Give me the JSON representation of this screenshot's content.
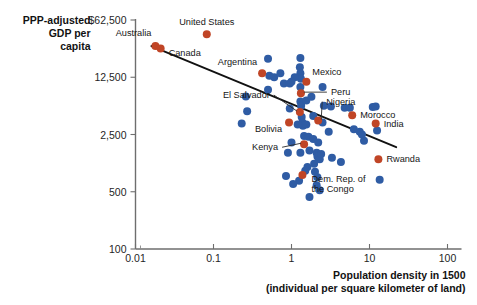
{
  "chart_data": {
    "type": "scatter",
    "title": "",
    "xlabel": "Population density in 1500",
    "xlabel_sub": "(individual per square kilometer of land)",
    "ylabel_lines": [
      "PPP-adjusted",
      "GDP per",
      "capita"
    ],
    "xscale": "log",
    "yscale": "log",
    "xlim": [
      0.01,
      100
    ],
    "ylim": [
      100,
      62500
    ],
    "grid": false,
    "legend": "none",
    "xticks": [
      "0.01",
      "0.1",
      "1",
      "10",
      "100"
    ],
    "xtick_values": [
      0.01,
      0.1,
      1,
      10,
      100
    ],
    "yticks": [
      "$62,500",
      "12,500",
      "2,500",
      "500",
      "100"
    ],
    "ytick_values": [
      62500,
      12500,
      2500,
      500,
      100
    ],
    "colors": {
      "highlight": "#c04526",
      "regular": "#2f5ca4",
      "trendline": "#111111",
      "axis": "#6e6e6e",
      "text": "#1b1b1b"
    },
    "trendline": {
      "x0": 0.016,
      "y0": 30000,
      "x1": 22,
      "y1": 1750,
      "note": "downward sloping fit line"
    },
    "labeled_points": [
      {
        "name": "Australia",
        "x": 0.018,
        "y": 30000,
        "color": "highlight",
        "label_dx": -4,
        "label_dy": -10,
        "anchor": "end"
      },
      {
        "name": "Canada",
        "x": 0.021,
        "y": 28000,
        "color": "highlight",
        "label_dx": 8,
        "label_dy": 7,
        "anchor": "start"
      },
      {
        "name": "United States",
        "x": 0.082,
        "y": 42000,
        "color": "highlight",
        "label_dx": 0,
        "label_dy": -9,
        "anchor": "middle"
      },
      {
        "name": "Argentina",
        "x": 0.42,
        "y": 14000,
        "color": "highlight",
        "label_dx": -5,
        "label_dy": -8,
        "anchor": "end"
      },
      {
        "name": "Mexico",
        "x": 1.55,
        "y": 11000,
        "color": "highlight",
        "label_dx": 6,
        "label_dy": -7,
        "anchor": "start"
      },
      {
        "name": "Peru",
        "x": 1.32,
        "y": 8000,
        "color": "highlight",
        "label_dx": 30,
        "label_dy": 2,
        "anchor": "start",
        "leader": true
      },
      {
        "name": "El Salvador",
        "x": 1.28,
        "y": 4700,
        "color": "highlight",
        "label_dx": -30,
        "label_dy": -14,
        "anchor": "end",
        "leader": true
      },
      {
        "name": "Nigeria",
        "x": 2.2,
        "y": 3700,
        "color": "highlight",
        "label_dx": 8,
        "label_dy": -16,
        "anchor": "start",
        "leader": true
      },
      {
        "name": "Morocco",
        "x": 6.0,
        "y": 4300,
        "color": "highlight",
        "label_dx": 8,
        "label_dy": 3,
        "anchor": "start"
      },
      {
        "name": "India",
        "x": 12.0,
        "y": 3400,
        "color": "highlight",
        "label_dx": 8,
        "label_dy": 3,
        "anchor": "start"
      },
      {
        "name": "Bolivia",
        "x": 0.93,
        "y": 3500,
        "color": "highlight",
        "label_dx": -7,
        "label_dy": 9,
        "anchor": "end"
      },
      {
        "name": "Kenya",
        "x": 1.45,
        "y": 1900,
        "color": "highlight",
        "label_dx": -26,
        "label_dy": 6,
        "anchor": "end",
        "leader": true
      },
      {
        "name": "Rwanda",
        "x": 13.0,
        "y": 1250,
        "color": "highlight",
        "label_dx": 8,
        "label_dy": 3,
        "anchor": "start"
      },
      {
        "name": "Dem. Rep. of",
        "x": 1.38,
        "y": 800,
        "color": "highlight",
        "label_dx": 9,
        "label_dy": 7,
        "anchor": "start"
      },
      {
        "name": "the Congo",
        "x": 1.38,
        "y": 800,
        "color": "highlight",
        "label_dx": 9,
        "label_dy": 17,
        "anchor": "start",
        "labelonly": true
      }
    ],
    "unlabeled_points": [
      {
        "x": 0.5,
        "y": 21000,
        "color": "regular"
      },
      {
        "x": 0.52,
        "y": 13000,
        "color": "regular"
      },
      {
        "x": 0.6,
        "y": 12500,
        "color": "regular"
      },
      {
        "x": 0.5,
        "y": 8800,
        "color": "regular"
      },
      {
        "x": 0.26,
        "y": 7300,
        "color": "regular"
      },
      {
        "x": 0.27,
        "y": 4800,
        "color": "regular"
      },
      {
        "x": 0.23,
        "y": 3400,
        "color": "regular"
      },
      {
        "x": 0.72,
        "y": 14000,
        "color": "regular"
      },
      {
        "x": 0.8,
        "y": 10500,
        "color": "regular"
      },
      {
        "x": 1.3,
        "y": 21500,
        "color": "regular"
      },
      {
        "x": 1.28,
        "y": 16500,
        "color": "regular"
      },
      {
        "x": 1.3,
        "y": 14000,
        "color": "regular"
      },
      {
        "x": 1.32,
        "y": 12000,
        "color": "regular"
      },
      {
        "x": 1.1,
        "y": 12500,
        "color": "regular"
      },
      {
        "x": 0.95,
        "y": 10500,
        "color": "regular"
      },
      {
        "x": 1.0,
        "y": 11000,
        "color": "regular"
      },
      {
        "x": 1.3,
        "y": 9500,
        "color": "regular"
      },
      {
        "x": 1.3,
        "y": 6300,
        "color": "regular"
      },
      {
        "x": 1.33,
        "y": 5600,
        "color": "regular"
      },
      {
        "x": 1.55,
        "y": 6500,
        "color": "regular"
      },
      {
        "x": 1.8,
        "y": 7200,
        "color": "regular"
      },
      {
        "x": 2.5,
        "y": 9500,
        "color": "regular"
      },
      {
        "x": 2.6,
        "y": 5600,
        "color": "regular"
      },
      {
        "x": 3.2,
        "y": 5500,
        "color": "regular"
      },
      {
        "x": 1.35,
        "y": 4100,
        "color": "regular"
      },
      {
        "x": 1.38,
        "y": 3500,
        "color": "regular"
      },
      {
        "x": 1.4,
        "y": 3200,
        "color": "regular"
      },
      {
        "x": 1.2,
        "y": 3300,
        "color": "regular"
      },
      {
        "x": 1.55,
        "y": 3300,
        "color": "regular"
      },
      {
        "x": 1.9,
        "y": 4200,
        "color": "regular"
      },
      {
        "x": 2.5,
        "y": 3500,
        "color": "regular"
      },
      {
        "x": 3.0,
        "y": 2700,
        "color": "regular"
      },
      {
        "x": 4.8,
        "y": 5300,
        "color": "regular"
      },
      {
        "x": 5.6,
        "y": 5300,
        "color": "regular"
      },
      {
        "x": 6.3,
        "y": 2900,
        "color": "regular"
      },
      {
        "x": 7.5,
        "y": 2700,
        "color": "regular"
      },
      {
        "x": 8.5,
        "y": 2100,
        "color": "regular"
      },
      {
        "x": 1.45,
        "y": 2400,
        "color": "regular"
      },
      {
        "x": 1.65,
        "y": 2350,
        "color": "regular"
      },
      {
        "x": 1.9,
        "y": 2200,
        "color": "regular"
      },
      {
        "x": 2.2,
        "y": 2000,
        "color": "regular"
      },
      {
        "x": 1.0,
        "y": 2000,
        "color": "regular"
      },
      {
        "x": 0.9,
        "y": 1500,
        "color": "regular"
      },
      {
        "x": 1.3,
        "y": 1500,
        "color": "regular"
      },
      {
        "x": 1.7,
        "y": 1600,
        "color": "regular"
      },
      {
        "x": 2.1,
        "y": 1500,
        "color": "regular"
      },
      {
        "x": 2.15,
        "y": 1350,
        "color": "regular"
      },
      {
        "x": 2.3,
        "y": 1250,
        "color": "regular"
      },
      {
        "x": 2.4,
        "y": 1450,
        "color": "regular"
      },
      {
        "x": 3.3,
        "y": 1300,
        "color": "regular"
      },
      {
        "x": 4.3,
        "y": 1150,
        "color": "regular"
      },
      {
        "x": 1.6,
        "y": 1000,
        "color": "regular"
      },
      {
        "x": 1.5,
        "y": 900,
        "color": "regular"
      },
      {
        "x": 2.0,
        "y": 880,
        "color": "regular"
      },
      {
        "x": 2.15,
        "y": 750,
        "color": "regular"
      },
      {
        "x": 1.25,
        "y": 680,
        "color": "regular"
      },
      {
        "x": 0.85,
        "y": 780,
        "color": "regular"
      },
      {
        "x": 1.05,
        "y": 620,
        "color": "regular"
      },
      {
        "x": 2.1,
        "y": 600,
        "color": "regular"
      },
      {
        "x": 2.3,
        "y": 520,
        "color": "regular"
      },
      {
        "x": 13.5,
        "y": 700,
        "color": "regular"
      },
      {
        "x": 12.5,
        "y": 2800,
        "color": "regular"
      },
      {
        "x": 11.0,
        "y": 5400,
        "color": "regular"
      },
      {
        "x": 12.0,
        "y": 5500,
        "color": "regular"
      },
      {
        "x": 8.0,
        "y": 2500,
        "color": "regular"
      },
      {
        "x": 1.95,
        "y": 1100,
        "color": "regular"
      },
      {
        "x": 1.7,
        "y": 430,
        "color": "regular"
      },
      {
        "x": 0.95,
        "y": 5200,
        "color": "regular"
      }
    ]
  }
}
